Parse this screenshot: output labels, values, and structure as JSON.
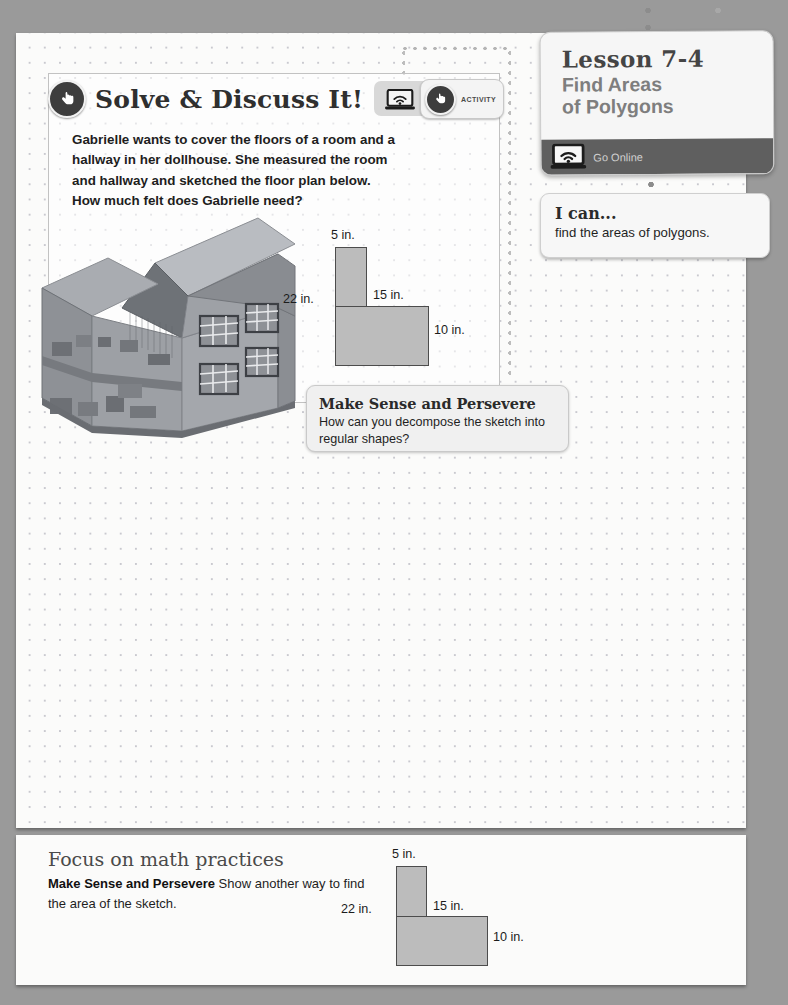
{
  "page": {
    "background_color": "#9a9a9a",
    "sheet_color": "#fbfbfa"
  },
  "solve_panel": {
    "title": "Solve & Discuss It!",
    "hand_icon": "hand-pointer-icon",
    "body": "Gabrielle wants to cover the floors of a room and a hallway in her dollhouse. She measured the room and hallway and sketched the floor plan below. How much felt does Gabrielle need?",
    "activity_button": {
      "label": "ACTIVITY",
      "laptop_icon": "laptop-wifi-icon",
      "hand_icon": "hand-pointer-icon"
    },
    "illustration": {
      "name": "dollhouse-cutaway-illustration",
      "alt": "Isometric cutaway dollhouse with open roof showing two furnished floors"
    }
  },
  "figure": {
    "name": "l-shaped-polygon-floor-plan",
    "fill_color": "#bcbcbc",
    "stroke_color": "#4c4c4c",
    "labels": {
      "top": "5 in.",
      "left": "22 in.",
      "middle": "15 in.",
      "right": "10 in."
    }
  },
  "make_sense_callout": {
    "title": "Make Sense and Persevere",
    "text": "How can you decompose the sketch into regular shapes?"
  },
  "lesson_card": {
    "number": "Lesson 7-4",
    "name_line1": "Find Areas",
    "name_line2": "of Polygons",
    "go_online_label": "Go Online",
    "go_online_icon": "laptop-wifi-icon",
    "bar_color": "#5f5f5f"
  },
  "i_can_card": {
    "title": "I can...",
    "text": "find the areas of polygons."
  },
  "focus_section": {
    "title": "Focus on math practices",
    "practice_label": "Make Sense and Persevere",
    "practice_text": "Show another way to find the area of the sketch.",
    "figure_labels": {
      "top": "5 in.",
      "left": "22 in.",
      "middle": "15 in.",
      "right": "10 in."
    }
  }
}
